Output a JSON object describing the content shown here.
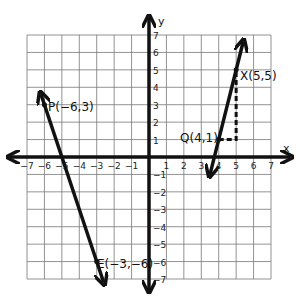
{
  "chart_data": {
    "type": "line",
    "title": "",
    "xlabel": "x",
    "ylabel": "y",
    "xlim": [
      -7,
      7
    ],
    "ylim": [
      -7,
      7
    ],
    "grid": true,
    "x_ticks": [
      "-7",
      "-6",
      "-5",
      "-4",
      "-3",
      "-2",
      "-1",
      "1",
      "2",
      "3",
      "4",
      "5",
      "6",
      "7"
    ],
    "y_ticks": [
      "7",
      "6",
      "5",
      "4",
      "3",
      "2",
      "1",
      "-1",
      "-2",
      "-3",
      "-4",
      "-5",
      "-6",
      "-7"
    ],
    "series": [
      {
        "name": "line PE",
        "points": [
          {
            "label": "P(-6,3)",
            "x": -6,
            "y": 3
          },
          {
            "label": "E(-3,-6)",
            "x": -3,
            "y": -6
          }
        ],
        "extends_to": [
          [
            -6.2,
            3.6
          ],
          [
            -2.6,
            -7.2
          ]
        ]
      },
      {
        "name": "line QX",
        "points": [
          {
            "label": "Q(4,1)",
            "x": 4,
            "y": 1
          },
          {
            "label": "X(5,5)",
            "x": 5,
            "y": 5
          }
        ],
        "extends_to": [
          [
            3.5,
            -1.0
          ],
          [
            5.4,
            6.6
          ]
        ]
      }
    ],
    "annotations": [
      {
        "type": "slope-triangle",
        "from": [
          4,
          1
        ],
        "corner": [
          5,
          1
        ],
        "to": [
          5,
          5
        ],
        "style": "dashed"
      }
    ]
  },
  "labels": {
    "x_axis": "x",
    "y_axis": "y",
    "P": "P(−6,3)",
    "E": "E(−3,−6)",
    "Q": "Q(4,1)",
    "X": "X(5,5)"
  }
}
